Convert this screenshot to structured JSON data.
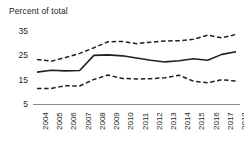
{
  "chart_data": {
    "type": "line",
    "title": "Percent of total",
    "xlabel": "",
    "ylabel": "",
    "ylim": [
      5,
      37
    ],
    "yticks": [
      5,
      15,
      25,
      35
    ],
    "grid": false,
    "legend": "none",
    "categories": [
      "2004",
      "2005",
      "2006",
      "2007",
      "2008",
      "2009",
      "2010",
      "2011",
      "2012",
      "2013",
      "2014",
      "2015",
      "2016",
      "2017",
      "2018"
    ],
    "series": [
      {
        "name": "upper-bound",
        "style": "dashed",
        "color": "#231f20",
        "values": [
          23.5,
          22.8,
          24.3,
          26.0,
          28.3,
          30.8,
          30.9,
          30.0,
          30.6,
          31.1,
          31.2,
          31.8,
          33.5,
          32.4,
          33.8
        ]
      },
      {
        "name": "estimate",
        "style": "solid",
        "color": "#231f20",
        "values": [
          18.3,
          19.1,
          18.8,
          19.0,
          25.2,
          25.4,
          25.0,
          24.1,
          23.2,
          22.5,
          23.0,
          23.8,
          23.2,
          25.6,
          26.7
        ]
      },
      {
        "name": "lower-bound",
        "style": "dashed",
        "color": "#231f20",
        "values": [
          11.6,
          11.6,
          12.7,
          12.6,
          15.3,
          17.1,
          15.7,
          15.5,
          15.6,
          16.0,
          17.0,
          14.6,
          13.9,
          15.2,
          14.6
        ]
      }
    ]
  },
  "axis": {
    "baseline_color": "#8c8c8c"
  }
}
